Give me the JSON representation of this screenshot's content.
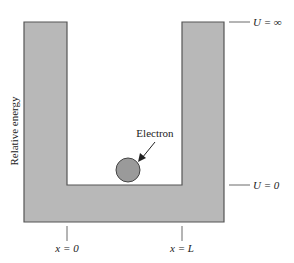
{
  "diagram": {
    "ylabel": "Relative energy",
    "particle_label": "Electron",
    "levels": {
      "top": "U = ∞",
      "bottom": "U = 0"
    },
    "x_ticks": [
      {
        "label": "x = 0"
      },
      {
        "label": "x = L"
      }
    ],
    "colors": {
      "wall_fill": "#b8b8b8",
      "wall_stroke": "#555555",
      "electron_fill": "#9a9a9a",
      "background": "#ffffff"
    }
  }
}
